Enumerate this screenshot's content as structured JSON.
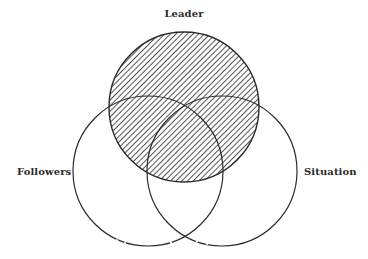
{
  "diagram": {
    "type": "three-circle-venn",
    "circles": [
      {
        "id": "leader",
        "label": "Leader",
        "cx": 184,
        "cy": 107,
        "r": 75,
        "fill": "hatched"
      },
      {
        "id": "followers",
        "label": "Followers",
        "cx": 148,
        "cy": 171,
        "r": 75,
        "fill": "none"
      },
      {
        "id": "situation",
        "label": "Situation",
        "cx": 222,
        "cy": 171,
        "r": 75,
        "fill": "none"
      }
    ],
    "colors": {
      "stroke": "#2a2a2a",
      "hatch": "#2a2a2a",
      "background": "#ffffff"
    }
  },
  "labels": {
    "leader": "Leader",
    "followers": "Followers",
    "situation": "Situation"
  }
}
